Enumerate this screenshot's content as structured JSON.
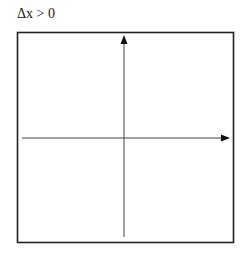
{
  "diagram": {
    "title": "Δx > 0",
    "box": {
      "x": 17,
      "y": 32,
      "width": 216,
      "height": 210,
      "stroke": "#222222"
    },
    "x_axis": {
      "y": 138,
      "x_start": 22,
      "x_end": 230,
      "color": "#444444"
    },
    "y_axis": {
      "x": 124,
      "y_start": 237,
      "y_end": 36,
      "color": "#444444"
    }
  }
}
